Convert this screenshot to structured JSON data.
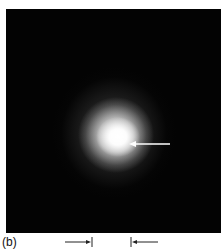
{
  "figure": {
    "panel_label": "(b)",
    "colors": {
      "background": "#030303",
      "spot_core": "#ffffff",
      "arrow": "#ffffff",
      "marker": "#222222"
    },
    "annotations": {
      "pointer_arrow": "arrow pointing left at bright spot center",
      "width_markers": "pair of inward-pointing arrows with end ticks indicating a width"
    }
  }
}
